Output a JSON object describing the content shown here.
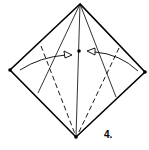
{
  "diagram": {
    "type": "origami-fold-step",
    "step_label": "4.",
    "colors": {
      "line": "#000000",
      "background": "#ffffff"
    },
    "elements": [
      "diamond-outline",
      "center-vertical-crease",
      "two-solid-diagonal-creases",
      "two-dashed-valley-fold-lines",
      "two-short-dashed-ticks",
      "two-curved-arrows-toward-center",
      "center-dot",
      "corner-dots"
    ]
  }
}
